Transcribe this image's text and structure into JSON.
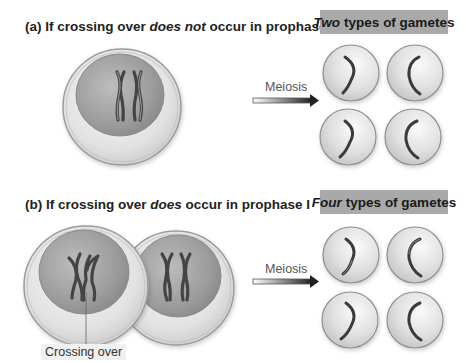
{
  "panel_a": {
    "title_prefix": "(a) If crossing over ",
    "title_emph": "does not",
    "title_suffix": " occur in prophase I",
    "badge_emph": "Two",
    "badge_rest": "types of gametes",
    "arrow_label": "Meiosis"
  },
  "panel_b": {
    "title_prefix": "(b) If crossing over ",
    "title_emph": "does",
    "title_suffix": " occur in prophase I",
    "badge_emph": "Four",
    "badge_rest": "types of gametes",
    "arrow_label": "Meiosis",
    "callout_label": "Crossing over"
  },
  "colors": {
    "badge_bg": "#a9a9a9",
    "cell_fill": "#e6e6e6",
    "nucleus_fill": "#9a9a9a",
    "chromosome": "#555555",
    "arrow_dark": "#222222"
  }
}
